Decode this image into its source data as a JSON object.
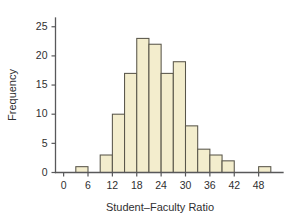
{
  "chart_data": {
    "type": "bar",
    "title": "",
    "subtitle": "",
    "xlabel": "Student–Faculty Ratio",
    "ylabel": "Frequency",
    "xlim": [
      -2,
      54
    ],
    "ylim": [
      0,
      26.5
    ],
    "grid": false,
    "legend": null,
    "bin_width": 3,
    "x_ticks": [
      0,
      6,
      12,
      18,
      24,
      30,
      36,
      42,
      48
    ],
    "x_tick_labels": [
      "0",
      "6",
      "12",
      "18",
      "24",
      "30",
      "36",
      "42",
      "48"
    ],
    "y_ticks": [
      0,
      5,
      10,
      15,
      20,
      25
    ],
    "y_tick_labels": [
      "0",
      "5",
      "10",
      "15",
      "20",
      "25"
    ],
    "bin_edges": [
      3,
      6,
      9,
      12,
      15,
      18,
      21,
      24,
      27,
      30,
      33,
      36,
      39,
      42,
      45,
      48,
      51
    ],
    "categories": [
      "3-6",
      "6-9",
      "9-12",
      "12-15",
      "15-18",
      "18-21",
      "21-24",
      "24-27",
      "27-30",
      "30-33",
      "33-36",
      "36-39",
      "39-42",
      "42-45",
      "45-48",
      "48-51"
    ],
    "values": [
      1,
      0,
      3,
      10,
      17,
      23,
      22,
      17,
      19,
      8,
      4,
      3,
      2,
      0,
      0,
      1
    ],
    "bars": [
      {
        "label": "3-6",
        "x0": 3,
        "x1": 6,
        "value": 1
      },
      {
        "label": "9-12",
        "x0": 9,
        "x1": 12,
        "value": 3
      },
      {
        "label": "12-15",
        "x0": 12,
        "x1": 15,
        "value": 10
      },
      {
        "label": "15-18",
        "x0": 15,
        "x1": 18,
        "value": 17
      },
      {
        "label": "18-21",
        "x0": 18,
        "x1": 21,
        "value": 23
      },
      {
        "label": "21-24",
        "x0": 21,
        "x1": 24,
        "value": 22
      },
      {
        "label": "24-27",
        "x0": 24,
        "x1": 27,
        "value": 17
      },
      {
        "label": "27-30",
        "x0": 27,
        "x1": 30,
        "value": 19
      },
      {
        "label": "30-33",
        "x0": 30,
        "x1": 33,
        "value": 8
      },
      {
        "label": "33-36",
        "x0": 33,
        "x1": 36,
        "value": 4
      },
      {
        "label": "36-39",
        "x0": 36,
        "x1": 39,
        "value": 3
      },
      {
        "label": "39-42",
        "x0": 39,
        "x1": 42,
        "value": 2
      },
      {
        "label": "48-51",
        "x0": 48,
        "x1": 51,
        "value": 1
      }
    ],
    "colors": {
      "bar_fill": "#f3edcd",
      "bar_stroke": "#59564a",
      "axis": "#58585a",
      "text": "#2f2f31",
      "background": "#ffffff"
    }
  }
}
